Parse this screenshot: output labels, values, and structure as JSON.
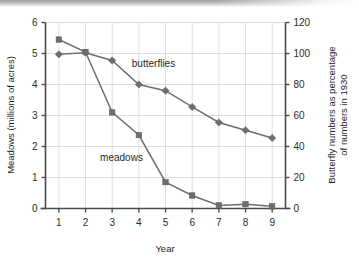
{
  "chart_data": {
    "type": "line",
    "title": "",
    "xlabel": "Year",
    "ylabel": "Meadows (millions of acres)",
    "y2label": "Butterfly numbers as percentage of numbers in 1930",
    "x": [
      1,
      2,
      3,
      4,
      5,
      6,
      7,
      8,
      9
    ],
    "xticklabels": [
      "1",
      "2",
      "3",
      "4",
      "5",
      "6",
      "7",
      "8",
      "9"
    ],
    "xlim": [
      0.5,
      9.5
    ],
    "ylim": [
      0,
      6
    ],
    "yticks": [
      0,
      1,
      2,
      3,
      4,
      5,
      6
    ],
    "yticklabels": [
      "0",
      "1",
      "2",
      "3",
      "4",
      "5",
      "6"
    ],
    "y2lim": [
      0,
      120
    ],
    "y2ticks": [
      0,
      20,
      40,
      60,
      80,
      100,
      120
    ],
    "y2ticklabels": [
      "0",
      "20",
      "40",
      "60",
      "80",
      "100",
      "120"
    ],
    "grid": true,
    "legend": "inline-annotations",
    "series": [
      {
        "name": "meadows",
        "axis": "left",
        "unit": "millions of acres",
        "marker": "square",
        "color": "#6e6e6e",
        "values": [
          5.45,
          5.05,
          3.1,
          2.37,
          0.85,
          0.42,
          0.1,
          0.14,
          0.07
        ]
      },
      {
        "name": "butterflies",
        "axis": "right",
        "unit": "percentage of 1930 numbers",
        "marker": "diamond",
        "color": "#6e6e6e",
        "values": [
          99.5,
          100.5,
          95.5,
          80.0,
          76.0,
          65.5,
          55.5,
          50.5,
          45.5
        ],
        "values_left_scale": [
          4.975,
          5.025,
          4.775,
          4.0,
          3.8,
          3.275,
          2.775,
          2.525,
          2.275
        ]
      }
    ],
    "annotations": [
      {
        "text": "butterflies",
        "x": 4.55,
        "y": 4.55
      },
      {
        "text": "meadows",
        "x": 3.35,
        "y": 1.52
      }
    ]
  },
  "colors": {
    "line": "#6e6e6e",
    "grid": "#d6d6d6",
    "axis": "#4a4a4a",
    "text": "#1f1f1f",
    "background": "#ffffff"
  }
}
